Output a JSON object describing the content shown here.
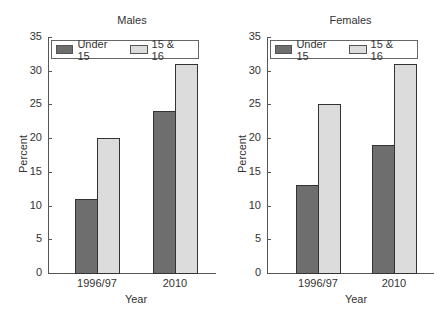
{
  "chart_data": [
    {
      "type": "bar",
      "title": "Males",
      "xlabel": "Year",
      "ylabel": "Percent",
      "ylim": [
        0,
        35
      ],
      "yticks": [
        0,
        5,
        10,
        15,
        20,
        25,
        30,
        35
      ],
      "categories": [
        "1996/97",
        "2010"
      ],
      "series": [
        {
          "name": "Under 15",
          "values": [
            11,
            24
          ],
          "color": "#6e6e6e"
        },
        {
          "name": "15 & 16",
          "values": [
            20,
            31
          ],
          "color": "#dcdcdc"
        }
      ],
      "legend_position": "top",
      "grid": false
    },
    {
      "type": "bar",
      "title": "Females",
      "xlabel": "Year",
      "ylabel": "Percent",
      "ylim": [
        0,
        35
      ],
      "yticks": [
        0,
        5,
        10,
        15,
        20,
        25,
        30,
        35
      ],
      "categories": [
        "1996/97",
        "2010"
      ],
      "series": [
        {
          "name": "Under 15",
          "values": [
            13,
            19
          ],
          "color": "#6e6e6e"
        },
        {
          "name": "15 & 16",
          "values": [
            25,
            31
          ],
          "color": "#dcdcdc"
        }
      ],
      "legend_position": "top",
      "grid": false
    }
  ]
}
